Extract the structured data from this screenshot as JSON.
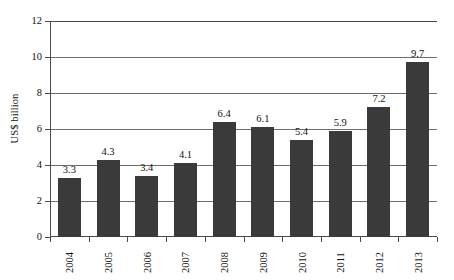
{
  "chart_data": {
    "type": "bar",
    "title": "",
    "xlabel": "",
    "ylabel": "US$ billion",
    "categories": [
      "2004",
      "2005",
      "2006",
      "2007",
      "2008",
      "2009",
      "2010",
      "2011",
      "2012",
      "2013"
    ],
    "values": [
      3.3,
      4.3,
      3.4,
      4.1,
      6.4,
      6.1,
      5.4,
      5.9,
      7.2,
      9.7
    ],
    "value_labels": [
      "3.3",
      "4.3",
      "3.4",
      "4.1",
      "6.4",
      "6.1",
      "5.4",
      "5.9",
      "7.2",
      "9.7"
    ],
    "ylim": [
      0,
      12
    ],
    "ytick_values": [
      0,
      2,
      4,
      6,
      8,
      10,
      12
    ],
    "ytick_labels": [
      "0",
      "2",
      "4",
      "6",
      "8",
      "10",
      "12"
    ],
    "grid": "horizontal",
    "legend": "none",
    "bar_color": "#3a3a3a",
    "axis_color": "#4a4a4a",
    "gridline_color": "#6d6d6d",
    "background_color": "#ffffff"
  }
}
